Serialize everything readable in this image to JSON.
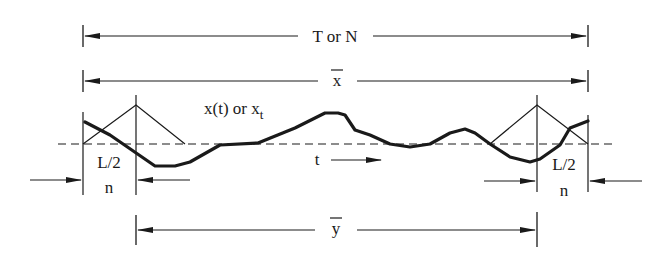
{
  "diagram": {
    "type": "time-series windowing / bootstrap block schematic",
    "colors": {
      "ink": "#1a1a1a",
      "background": "#ffffff"
    },
    "labels": {
      "total_span": "T or N",
      "x_mean_main": "x",
      "series": "x(t) or x",
      "series_subscript": "t",
      "time_axis": "t",
      "left_half_window": "L/2",
      "left_n": "n",
      "right_half_window": "L/2",
      "right_n": "n",
      "y_mean_main": "y"
    },
    "dimensions": [
      {
        "name": "T or N",
        "from_x": 83,
        "to_x": 588,
        "y": 36
      },
      {
        "name": "x-bar",
        "from_x": 83,
        "to_x": 588,
        "y": 81
      },
      {
        "name": "y-bar",
        "from_x": 136,
        "to_x": 537,
        "y": 230
      }
    ],
    "windows": [
      {
        "side": "left",
        "start_x": 83,
        "peak_x": 136,
        "end_x": 185,
        "half_width_label": "L/2",
        "count_label": "n"
      },
      {
        "side": "right",
        "start_x": 490,
        "peak_x": 537,
        "end_x": 588,
        "half_width_label": "L/2",
        "count_label": "n"
      }
    ],
    "baseline": {
      "style": "dashed",
      "y": 144
    },
    "curve_points": [
      [
        85,
        122
      ],
      [
        110,
        135
      ],
      [
        155,
        166
      ],
      [
        175,
        166
      ],
      [
        190,
        162
      ],
      [
        220,
        145
      ],
      [
        258,
        143
      ],
      [
        295,
        128
      ],
      [
        325,
        113
      ],
      [
        338,
        113
      ],
      [
        345,
        115
      ],
      [
        355,
        130
      ],
      [
        370,
        135
      ],
      [
        390,
        144
      ],
      [
        410,
        147
      ],
      [
        430,
        144
      ],
      [
        450,
        133
      ],
      [
        465,
        129
      ],
      [
        475,
        133
      ],
      [
        490,
        144
      ],
      [
        510,
        157
      ],
      [
        530,
        162
      ],
      [
        540,
        159
      ],
      [
        560,
        145
      ],
      [
        570,
        128
      ],
      [
        588,
        121
      ]
    ]
  }
}
